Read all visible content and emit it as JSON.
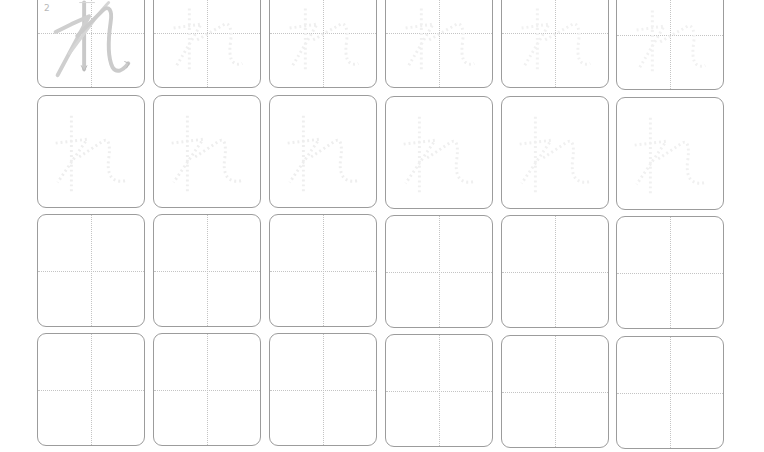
{
  "worksheet": {
    "character": "れ",
    "stroke_numbers": [
      "2"
    ],
    "colors": {
      "border": "#9c9c9c",
      "guide": "#c4c4c4",
      "stroke_model": "#c8c8c8",
      "trace": "#ececec"
    },
    "rows": [
      {
        "type": "stroke-order-and-trace",
        "boxes": 6
      },
      {
        "type": "trace",
        "boxes": 6
      },
      {
        "type": "blank-practice",
        "boxes": 6
      },
      {
        "type": "blank-practice",
        "boxes": 6
      }
    ]
  }
}
